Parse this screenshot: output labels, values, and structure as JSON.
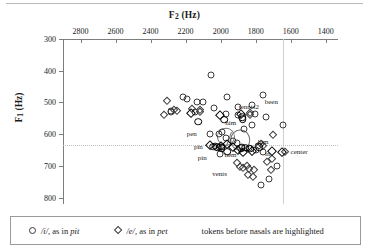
{
  "chart_data": {
    "type": "scatter",
    "title": "",
    "xlabel": "F2 (Hz)",
    "ylabel": "F1 (Hz)",
    "xlabel_main": "F",
    "xlabel_sub": "2",
    "xlabel_unit": " (Hz)",
    "ylabel_main": "F",
    "ylabel_sub": "1",
    "ylabel_unit": " (Hz)",
    "xlim": [
      2900,
      1330
    ],
    "ylim": [
      300,
      820
    ],
    "x_axis_reversed": true,
    "y_axis_reversed": true,
    "x_axis_position": "top",
    "xticks": [
      2800,
      2600,
      2400,
      2200,
      2000,
      1800,
      1600,
      1400
    ],
    "yticks": [
      300,
      400,
      500,
      600,
      700,
      800
    ],
    "grid": false,
    "reference_lines": [
      {
        "orientation": "horizontal",
        "value": 635,
        "style": "dotted"
      },
      {
        "orientation": "vertical",
        "value": 1645,
        "style": "solid"
      }
    ],
    "series": [
      {
        "name": "/i/, as in pit",
        "marker": "circle",
        "points": [
          {
            "x": 2056,
            "y": 415
          },
          {
            "x": 2215,
            "y": 483
          },
          {
            "x": 2190,
            "y": 490
          },
          {
            "x": 1962,
            "y": 484
          },
          {
            "x": 2136,
            "y": 499
          },
          {
            "x": 2100,
            "y": 500
          },
          {
            "x": 1761,
            "y": 478
          },
          {
            "x": 1822,
            "y": 508
          },
          {
            "x": 1900,
            "y": 513
          },
          {
            "x": 2036,
            "y": 518
          },
          {
            "x": 2283,
            "y": 528
          },
          {
            "x": 2281,
            "y": 530
          },
          {
            "x": 2149,
            "y": 530
          },
          {
            "x": 1972,
            "y": 536
          },
          {
            "x": 1902,
            "y": 540
          },
          {
            "x": 1806,
            "y": 537
          },
          {
            "x": 1741,
            "y": 545
          },
          {
            "x": 1823,
            "y": 570
          },
          {
            "x": 1645,
            "y": 570
          },
          {
            "x": 1866,
            "y": 583
          },
          {
            "x": 2059,
            "y": 599
          },
          {
            "x": 2009,
            "y": 600
          },
          {
            "x": 1992,
            "y": 592
          },
          {
            "x": 1972,
            "y": 612
          },
          {
            "x": 1930,
            "y": 622
          },
          {
            "x": 1909,
            "y": 629
          },
          {
            "x": 2035,
            "y": 636
          },
          {
            "x": 2010,
            "y": 639
          },
          {
            "x": 1993,
            "y": 641
          },
          {
            "x": 1878,
            "y": 640
          },
          {
            "x": 1836,
            "y": 645
          },
          {
            "x": 1800,
            "y": 651
          },
          {
            "x": 1786,
            "y": 638
          },
          {
            "x": 2006,
            "y": 662
          },
          {
            "x": 1760,
            "y": 657
          },
          {
            "x": 1681,
            "y": 700
          },
          {
            "x": 1726,
            "y": 740
          },
          {
            "x": 1768,
            "y": 760
          }
        ]
      },
      {
        "name": "/e/, as in pet",
        "marker": "diamond",
        "points": [
          {
            "x": 2307,
            "y": 496
          },
          {
            "x": 2326,
            "y": 541
          },
          {
            "x": 2264,
            "y": 523
          },
          {
            "x": 2252,
            "y": 527
          },
          {
            "x": 2164,
            "y": 521
          },
          {
            "x": 2120,
            "y": 525
          },
          {
            "x": 2120,
            "y": 530
          },
          {
            "x": 1834,
            "y": 532
          },
          {
            "x": 1832,
            "y": 538
          },
          {
            "x": 1700,
            "y": 601
          },
          {
            "x": 1768,
            "y": 632
          },
          {
            "x": 1760,
            "y": 637
          },
          {
            "x": 1630,
            "y": 655
          },
          {
            "x": 1905,
            "y": 692
          },
          {
            "x": 1890,
            "y": 702
          },
          {
            "x": 1871,
            "y": 706
          },
          {
            "x": 1852,
            "y": 699
          },
          {
            "x": 1838,
            "y": 709
          },
          {
            "x": 1812,
            "y": 713
          },
          {
            "x": 1843,
            "y": 729
          },
          {
            "x": 1818,
            "y": 736
          },
          {
            "x": 1738,
            "y": 689
          },
          {
            "x": 1706,
            "y": 678
          },
          {
            "x": 1713,
            "y": 713
          }
        ]
      },
      {
        "name": "/i/ highlighted (pre-nasal)",
        "marker": "circle",
        "highlighted": true,
        "points": [
          {
            "x": 2127,
            "y": 561
          },
          {
            "x": 1978,
            "y": 554
          },
          {
            "x": 1876,
            "y": 547
          },
          {
            "x": 1874,
            "y": 553
          },
          {
            "x": 2043,
            "y": 639
          },
          {
            "x": 2021,
            "y": 641
          },
          {
            "x": 1995,
            "y": 645
          },
          {
            "x": 1961,
            "y": 655
          },
          {
            "x": 1884,
            "y": 645
          },
          {
            "x": 1861,
            "y": 642
          },
          {
            "x": 1831,
            "y": 646
          },
          {
            "x": 1781,
            "y": 641
          }
        ]
      },
      {
        "name": "/e/ highlighted (pre-nasal)",
        "marker": "diamond",
        "highlighted": true,
        "points": [
          {
            "x": 2172,
            "y": 534
          },
          {
            "x": 2004,
            "y": 539
          },
          {
            "x": 1882,
            "y": 535
          },
          {
            "x": 2063,
            "y": 634
          },
          {
            "x": 1997,
            "y": 637
          },
          {
            "x": 1966,
            "y": 630
          },
          {
            "x": 1931,
            "y": 640
          },
          {
            "x": 1900,
            "y": 649
          },
          {
            "x": 1871,
            "y": 655
          },
          {
            "x": 1822,
            "y": 652
          },
          {
            "x": 1706,
            "y": 653
          },
          {
            "x": 1649,
            "y": 655
          }
        ]
      }
    ],
    "ellipses": [
      {
        "cx": 1968,
        "cy": 608,
        "rx": 46,
        "ry": 26
      },
      {
        "cx": 1887,
        "cy": 618,
        "rx": 50,
        "ry": 30
      }
    ],
    "annotations": [
      {
        "text": "been",
        "x": 1760,
        "y": 500,
        "anchor": "left"
      },
      {
        "text": "tennis2",
        "x": 1908,
        "y": 513,
        "anchor": "left"
      },
      {
        "text": "him",
        "x": 1985,
        "y": 564,
        "anchor": "left"
      },
      {
        "text": "pen",
        "x": 2125,
        "y": 600,
        "anchor": "right"
      },
      {
        "text": "him",
        "x": 1800,
        "y": 625,
        "anchor": "left"
      },
      {
        "text": "pin",
        "x": 2090,
        "y": 641,
        "anchor": "right"
      },
      {
        "text": "hem",
        "x": 1990,
        "y": 664,
        "anchor": "left"
      },
      {
        "text": "in",
        "x": 1758,
        "y": 662,
        "anchor": "left"
      },
      {
        "text": "center",
        "x": 1612,
        "y": 655,
        "anchor": "left"
      },
      {
        "text": "pin",
        "x": 2068,
        "y": 675,
        "anchor": "right"
      },
      {
        "text": "vents",
        "x": 1952,
        "y": 726,
        "anchor": "right"
      }
    ]
  },
  "legend": {
    "items": [
      {
        "symbol": "circle-marker",
        "label_phone": "/i/",
        "label_rest": ", as in ",
        "label_word": "pit"
      },
      {
        "symbol": "diamond-marker",
        "label_phone": "/e/",
        "label_rest": ", as in ",
        "label_word": "pet"
      }
    ],
    "note": "tokens before nasals are highlighted"
  }
}
